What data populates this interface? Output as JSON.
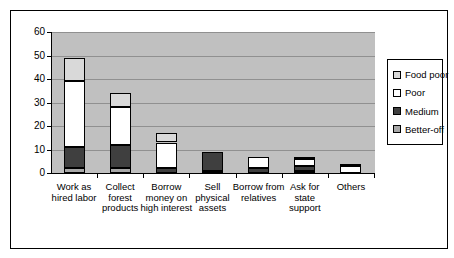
{
  "chart_data": {
    "type": "bar",
    "stacked": true,
    "title": "",
    "xlabel": "",
    "ylabel": "",
    "categories": [
      "Work as hired labor",
      "Collect forest products",
      "Borrow money on high interest",
      "Sell physical assets",
      "Borrow from relatives",
      "Ask for state support",
      "Others"
    ],
    "series": [
      {
        "name": "Better-off",
        "color": "#a8a8a8",
        "values": [
          2,
          2,
          0,
          1,
          0,
          1,
          0
        ]
      },
      {
        "name": "Medium",
        "color": "#3f3f3f",
        "values": [
          9,
          10,
          2,
          8,
          2,
          2,
          0
        ]
      },
      {
        "name": "Poor",
        "color": "#ffffff",
        "values": [
          28,
          16,
          11,
          0,
          5,
          3,
          3
        ]
      },
      {
        "name": "Food poor",
        "color": "#d9d9d9",
        "values": [
          10,
          6,
          4,
          0,
          0,
          1,
          1
        ]
      }
    ],
    "totals": [
      49,
      34,
      17,
      9,
      7,
      7,
      4
    ],
    "legend_order": [
      "Food poor",
      "Poor",
      "Medium",
      "Better-off"
    ],
    "legend_position": "right",
    "ylim": [
      0,
      60
    ],
    "ytick_step": 10,
    "ytick_labels": [
      "0",
      "10",
      "20",
      "30",
      "40",
      "50",
      "60"
    ],
    "grid": true,
    "plot_bg_color": "#c0c0c0",
    "gridline_color": "#909090",
    "bar_border_color": "#000000",
    "figure_bg_color": "#ffffff"
  }
}
